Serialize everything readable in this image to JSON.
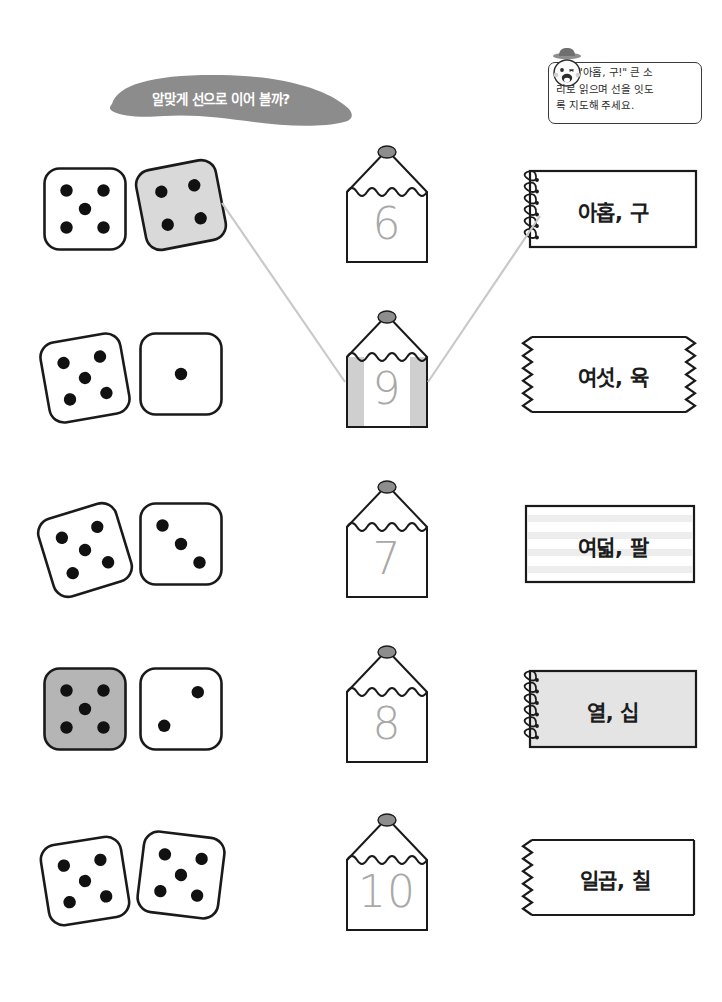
{
  "worksheet": {
    "banner_text": "알맞게 선으로 이어 볼까?",
    "banner_color": "#8c8c8c",
    "tip": {
      "line1": "\"아홉, 구!\" 큰 소",
      "line2": "리로 읽으며 선을 잇도",
      "line3": "록 지도해 주세요.",
      "icon": "teacher-face-icon"
    }
  },
  "rows": [
    {
      "dice": {
        "left": {
          "pips": 5,
          "fill": "#ffffff",
          "rotate": 0
        },
        "right": {
          "pips": 4,
          "fill": "#d9d9d9",
          "rotate": -11
        }
      },
      "pencil": {
        "number": "6",
        "striped": false
      },
      "card": {
        "text": "아홉, 구",
        "style": "spiral",
        "fill": "#ffffff"
      }
    },
    {
      "dice": {
        "left": {
          "pips": 5,
          "fill": "#ffffff",
          "rotate": -10
        },
        "right": {
          "pips": 1,
          "fill": "#ffffff",
          "rotate": 0
        }
      },
      "pencil": {
        "number": "9",
        "striped": true
      },
      "card": {
        "text": "여섯, 육",
        "style": "torn-both",
        "fill": "#ffffff"
      }
    },
    {
      "dice": {
        "left": {
          "pips": 5,
          "fill": "#ffffff",
          "rotate": -17
        },
        "right": {
          "pips": 3,
          "fill": "#ffffff",
          "rotate": 0
        }
      },
      "pencil": {
        "number": "7",
        "striped": false
      },
      "card": {
        "text": "여덟, 팔",
        "style": "lined",
        "fill": "#ffffff"
      }
    },
    {
      "dice": {
        "left": {
          "pips": 5,
          "fill": "#b5b5b5",
          "rotate": 0
        },
        "right": {
          "pips": 2,
          "fill": "#ffffff",
          "rotate": 0
        }
      },
      "pencil": {
        "number": "8",
        "striped": false
      },
      "card": {
        "text": "열, 십",
        "style": "spiral",
        "fill": "#e4e4e4"
      }
    },
    {
      "dice": {
        "left": {
          "pips": 5,
          "fill": "#ffffff",
          "rotate": -9
        },
        "right": {
          "pips": 5,
          "fill": "#ffffff",
          "rotate": 7
        }
      },
      "pencil": {
        "number": "10",
        "striped": false
      },
      "card": {
        "text": "일곱, 칠",
        "style": "torn-left",
        "fill": "#ffffff"
      }
    }
  ],
  "connections": [
    {
      "from": "dice-row-1",
      "to": "pencil-9",
      "color": "#c9c9c9"
    },
    {
      "from": "pencil-9",
      "to": "card-아홉-구",
      "color": "#c9c9c9"
    }
  ]
}
